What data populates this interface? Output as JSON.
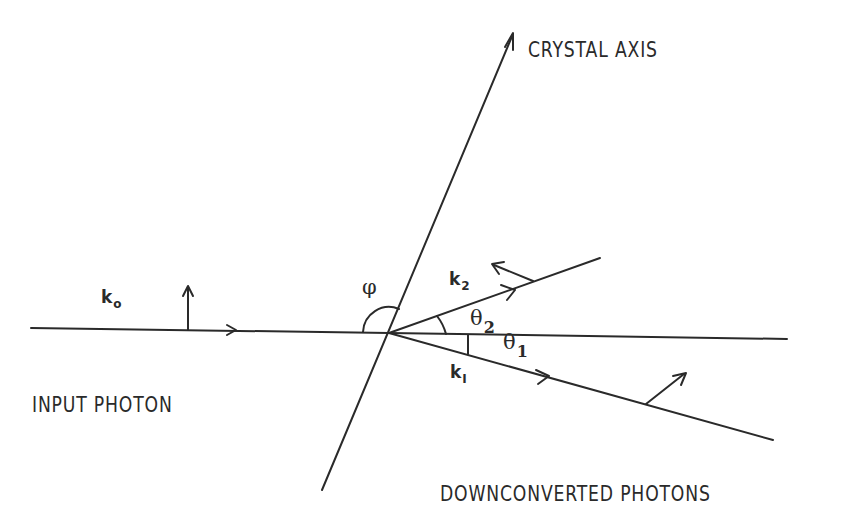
{
  "diagram": {
    "labels": {
      "crystal_axis": "CRYSTAL AXIS",
      "input_photon": "INPUT PHOTON",
      "downconverted_photons": "DOWNCONVERTED PHOTONS",
      "k0": "k",
      "k0_sub": "o",
      "k1": "k",
      "k1_sub": "I",
      "k2": "k",
      "k2_sub": "2",
      "phi": "φ",
      "theta1": "θ",
      "theta1_sub": "1",
      "theta2": "θ",
      "theta2_sub": "2"
    },
    "elements": [
      {
        "name": "input-photon-beam",
        "desc": "horizontal line with forward arrow and vertical polarization arrow"
      },
      {
        "name": "crystal-axis",
        "desc": "tilted line through origin with arrow at top"
      },
      {
        "name": "k2-beam",
        "desc": "upper downconverted photon, angle theta2 above horizontal"
      },
      {
        "name": "k1-beam",
        "desc": "lower downconverted photon, angle theta1 below horizontal"
      },
      {
        "name": "reference-line",
        "desc": "horizontal continuation of input direction"
      }
    ],
    "stroke_color": "#2a2a2a",
    "background": "#ffffff"
  }
}
